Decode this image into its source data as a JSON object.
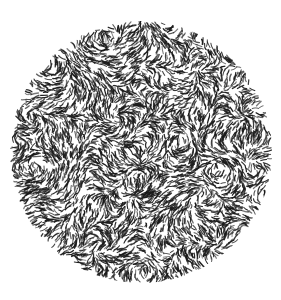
{
  "figure": {
    "title": "",
    "caption": "",
    "background_color": "#ffffff",
    "canvas_width": 281,
    "canvas_height": 300
  },
  "chart_data": {
    "type": "scatter",
    "title": "",
    "subtitle": "",
    "xlabel": "",
    "ylabel": "",
    "grid": false,
    "legend_position": "none",
    "description": "Circular aperture filled with a dense random field of short curved oriented line elements (comma-like dashes) rendered in dark gray on white.",
    "aperture": {
      "shape": "circle",
      "center_x": 141,
      "center_y": 152,
      "radius": 131,
      "edge_softness_px": 1.5
    },
    "element": {
      "name": "curved-dash",
      "count": 5200,
      "length_min_px": 3.5,
      "length_max_px": 8.0,
      "line_width_px": 1.05,
      "curvature_min": -1.5,
      "curvature_max": 1.5,
      "color": "#1a1a1a",
      "alpha_min": 0.55,
      "alpha_max": 1.0,
      "orientation": "random with local coherence",
      "coherence_scale_px": 26,
      "jitter_deg": 48
    },
    "colors": {
      "stroke": "#1a1a1a",
      "background": "#ffffff"
    },
    "seed": 20240617,
    "xlim": [
      0,
      281
    ],
    "ylim": [
      0,
      300
    ]
  }
}
